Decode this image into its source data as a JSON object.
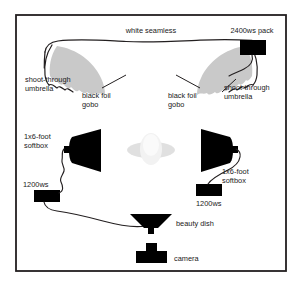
{
  "diagram": {
    "frame": {
      "x": 15,
      "y": 14,
      "width": 272,
      "height": 258,
      "stroke": "#231f20",
      "fill": "#ffffff",
      "stroke_width": 2
    },
    "colors": {
      "ink": "#231f20",
      "text": "#1a1a1a",
      "equipment_black": "#000000",
      "umbrella_gray": "#c9c9c9",
      "subject_gray": "#e9e9e9",
      "backdrop_line": "#231f20",
      "cable": "#231f20"
    },
    "labels": {
      "white_seamless": "white seamless",
      "pack_2400": "2400ws pack",
      "umbrella_left": {
        "line1": "shoot-through",
        "line2": "umbrella"
      },
      "umbrella_right": {
        "line1": "shoot-through",
        "line2": "umbrella"
      },
      "gobo_left": {
        "line1": "black foil",
        "line2": "gobo"
      },
      "gobo_right": {
        "line1": "black foil",
        "line2": "gobo"
      },
      "softbox_left": {
        "line1": "1x6-foot",
        "line2": "softbox"
      },
      "softbox_right": {
        "line1": "1x6-foot",
        "line2": "softbox"
      },
      "pack_1200_left": "1200ws",
      "pack_1200_right": "1200ws",
      "beauty_dish": "beauty dish",
      "camera": "camera"
    },
    "elements": [
      {
        "name": "white-seamless-backdrop",
        "type": "backdrop",
        "label": "white seamless"
      },
      {
        "name": "power-pack-2400ws",
        "type": "power-pack",
        "label": "2400ws pack",
        "watt_seconds": 2400
      },
      {
        "name": "shoot-through-umbrella-left",
        "type": "umbrella",
        "label": "shoot-through umbrella"
      },
      {
        "name": "shoot-through-umbrella-right",
        "type": "umbrella",
        "label": "shoot-through umbrella"
      },
      {
        "name": "black-foil-gobo-left",
        "type": "gobo",
        "label": "black foil gobo"
      },
      {
        "name": "black-foil-gobo-right",
        "type": "gobo",
        "label": "black foil gobo"
      },
      {
        "name": "softbox-left",
        "type": "softbox",
        "label": "1x6-foot softbox",
        "size": "1x6-foot"
      },
      {
        "name": "softbox-right",
        "type": "softbox",
        "label": "1x6-foot softbox",
        "size": "1x6-foot"
      },
      {
        "name": "power-pack-1200ws-left",
        "type": "power-pack",
        "label": "1200ws",
        "watt_seconds": 1200
      },
      {
        "name": "power-pack-1200ws-right",
        "type": "power-pack",
        "label": "1200ws",
        "watt_seconds": 1200
      },
      {
        "name": "beauty-dish",
        "type": "modifier",
        "label": "beauty dish"
      },
      {
        "name": "camera",
        "type": "camera",
        "label": "camera"
      },
      {
        "name": "subject",
        "type": "subject",
        "label": ""
      }
    ]
  }
}
